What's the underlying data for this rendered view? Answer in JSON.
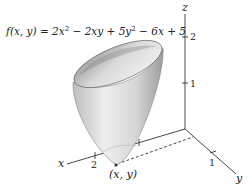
{
  "figure": {
    "function_label": {
      "lhs": "f(x, y) = ",
      "t1": "2x",
      "e1": "2",
      "t2": " − 2xy + 5y",
      "e2": "2",
      "t3": " − 6x + 5"
    },
    "axes": {
      "x": {
        "name": "x",
        "tick_labels": [
          "2"
        ]
      },
      "y": {
        "name": "y",
        "tick_labels": [
          "1"
        ]
      },
      "z": {
        "name": "z",
        "tick_labels": [
          "2",
          "1"
        ]
      }
    },
    "point_label": "(x, y)",
    "colors": {
      "axis": "#333333",
      "surface_light": "#f2f2f2",
      "surface_dark": "#9a9a9a",
      "text": "#222222"
    }
  }
}
